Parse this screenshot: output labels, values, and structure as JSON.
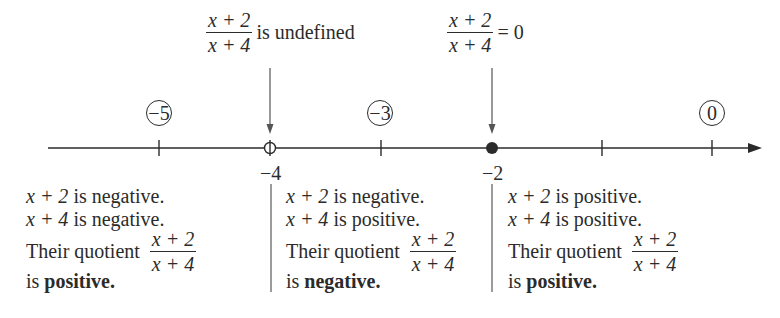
{
  "annotations": {
    "undefined": {
      "numerator": "x + 2",
      "denominator": "x + 4",
      "text": "is undefined"
    },
    "zero": {
      "numerator": "x + 2",
      "denominator": "x + 4",
      "text": "= 0"
    }
  },
  "number_line": {
    "test_points": [
      "−5",
      "−3",
      "0"
    ],
    "critical_points": [
      {
        "value": "−4",
        "marker": "open-circle",
        "meaning": "undefined"
      },
      {
        "value": "−2",
        "marker": "closed-dot",
        "meaning": "zero"
      }
    ],
    "ticks": [
      "−5",
      "−4",
      "−3",
      "−2",
      "−1",
      "0"
    ]
  },
  "intervals": [
    {
      "line1_var": "x + 2",
      "line1_text": " is negative.",
      "line2_var": "x + 4",
      "line2_text": " is negative.",
      "quotient_label": "Their quotient",
      "numerator": "x + 2",
      "denominator": "x + 4",
      "result_prefix": "is ",
      "result": "positive."
    },
    {
      "line1_var": "x + 2",
      "line1_text": " is negative.",
      "line2_var": "x + 4",
      "line2_text": " is positive.",
      "quotient_label": "Their quotient",
      "numerator": "x + 2",
      "denominator": "x + 4",
      "result_prefix": "is ",
      "result": "negative."
    },
    {
      "line1_var": "x + 2",
      "line1_text": " is positive.",
      "line2_var": "x + 4",
      "line2_text": " is positive.",
      "quotient_label": "Their quotient",
      "numerator": "x + 2",
      "denominator": "x + 4",
      "result_prefix": "is ",
      "result": "positive."
    }
  ],
  "colors": {
    "ink": "#2b2b2b",
    "background": "#ffffff"
  }
}
